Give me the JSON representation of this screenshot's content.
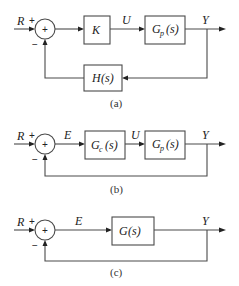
{
  "diagrams": [
    {
      "caption": "(a)",
      "input": "R",
      "plus": "+",
      "minus": "−",
      "sum": "+",
      "blocks": [
        {
          "label": "K",
          "main": "K",
          "sub": ""
        },
        {
          "label": "Gp(s)",
          "main": "G",
          "sub": "p",
          "arg": "(s)"
        }
      ],
      "signals": {
        "u": "U",
        "y": "Y"
      },
      "feedback_block": {
        "main": "H",
        "arg": "(s)"
      }
    },
    {
      "caption": "(b)",
      "input": "R",
      "plus": "+",
      "minus": "−",
      "sum": "+",
      "blocks": [
        {
          "label": "Gc(s)",
          "main": "G",
          "sub": "c",
          "arg": "(s)"
        },
        {
          "label": "Gp(s)",
          "main": "G",
          "sub": "p",
          "arg": "(s)"
        }
      ],
      "signals": {
        "e": "E",
        "u": "U",
        "y": "Y"
      }
    },
    {
      "caption": "(c)",
      "input": "R",
      "plus": "+",
      "minus": "−",
      "sum": "+",
      "blocks": [
        {
          "label": "G(s)",
          "main": "G",
          "arg": "(s)"
        }
      ],
      "signals": {
        "e": "E",
        "y": "Y"
      }
    }
  ]
}
